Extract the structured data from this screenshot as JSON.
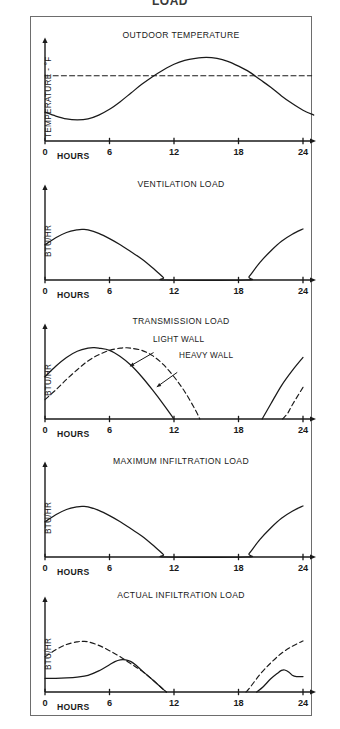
{
  "figure": {
    "cropped_heading": "LOAD",
    "x_axis_label": "HOURS",
    "x_ticks": [
      "0",
      "6",
      "12",
      "18",
      "24"
    ]
  },
  "chart_data": [
    {
      "type": "line",
      "title": "OUTDOOR TEMPERATURE",
      "xlabel": "HOURS",
      "ylabel": "TEMPERATURE - °F",
      "xlim": [
        0,
        24
      ],
      "ylim": [
        0,
        1
      ],
      "xticks": [
        0,
        6,
        12,
        18,
        24
      ],
      "grid": false,
      "legend": "inline-annotation",
      "annotations": [
        {
          "text": "INDOOR TEMPERATURE",
          "x": 1.2,
          "y": 0.74
        }
      ],
      "series": [
        {
          "name": "Outdoor temperature",
          "style": "solid",
          "x": [
            0,
            1,
            2,
            3,
            4,
            5,
            6,
            7,
            8,
            9,
            10,
            11,
            12,
            13,
            14,
            15,
            16,
            17,
            18,
            19,
            20,
            21,
            22,
            23,
            24,
            25
          ],
          "values": [
            0.3,
            0.26,
            0.23,
            0.22,
            0.23,
            0.27,
            0.33,
            0.41,
            0.5,
            0.59,
            0.67,
            0.74,
            0.8,
            0.84,
            0.86,
            0.87,
            0.86,
            0.83,
            0.78,
            0.72,
            0.64,
            0.56,
            0.47,
            0.39,
            0.32,
            0.27
          ]
        },
        {
          "name": "Indoor temperature",
          "style": "dashed",
          "x": [
            0,
            24.8
          ],
          "values": [
            0.68,
            0.68
          ]
        }
      ]
    },
    {
      "type": "line",
      "title": "VENTILATION LOAD",
      "xlabel": "HOURS",
      "ylabel": "BTU/HR",
      "xlim": [
        0,
        24
      ],
      "ylim": [
        0,
        1
      ],
      "xticks": [
        0,
        6,
        12,
        18,
        24
      ],
      "grid": false,
      "series": [
        {
          "name": "Ventilation load",
          "style": "solid",
          "x": [
            0,
            1,
            2,
            3,
            3.5,
            4,
            5,
            6,
            7,
            8,
            9,
            10,
            11,
            11.3,
            18.7,
            19,
            20,
            21,
            22,
            23,
            24
          ],
          "values": [
            0.4,
            0.48,
            0.54,
            0.57,
            0.575,
            0.57,
            0.53,
            0.47,
            0.4,
            0.32,
            0.24,
            0.14,
            0.03,
            0.0,
            0.0,
            0.04,
            0.2,
            0.33,
            0.44,
            0.52,
            0.58
          ]
        }
      ]
    },
    {
      "type": "line",
      "title": "TRANSMISSION LOAD",
      "xlabel": "HOURS",
      "ylabel": "BTU/HR",
      "xlim": [
        0,
        24
      ],
      "ylim": [
        0,
        1
      ],
      "xticks": [
        0,
        6,
        12,
        18,
        24
      ],
      "grid": false,
      "annotations": [
        {
          "text": "LIGHT WALL",
          "x": 10.4,
          "y": 0.8,
          "points_to": "Light wall"
        },
        {
          "text": "HEAVY WALL",
          "x": 12.6,
          "y": 0.62,
          "points_to": "Heavy wall"
        }
      ],
      "series": [
        {
          "name": "Light wall",
          "style": "solid",
          "x": [
            0,
            1,
            2,
            3,
            4,
            4.6,
            5,
            6,
            7,
            8,
            9,
            10,
            11,
            12
          ],
          "values": [
            0.48,
            0.6,
            0.7,
            0.77,
            0.805,
            0.81,
            0.805,
            0.78,
            0.71,
            0.61,
            0.48,
            0.33,
            0.17,
            0.0
          ]
        },
        {
          "name": "Heavy wall",
          "style": "dashed",
          "x": [
            0,
            1,
            2,
            3,
            4,
            5,
            6,
            7,
            7.6,
            8,
            9,
            10,
            11,
            12,
            13,
            14,
            14.4
          ],
          "values": [
            0.22,
            0.33,
            0.45,
            0.56,
            0.66,
            0.73,
            0.78,
            0.805,
            0.81,
            0.805,
            0.78,
            0.72,
            0.62,
            0.48,
            0.31,
            0.1,
            0.0
          ]
        },
        {
          "name": "Light wall evening",
          "style": "solid",
          "x": [
            20.2,
            21,
            22,
            23,
            24
          ],
          "values": [
            0.0,
            0.17,
            0.38,
            0.55,
            0.7
          ]
        },
        {
          "name": "Heavy wall evening",
          "style": "dashed",
          "x": [
            22.1,
            22.6,
            23,
            24
          ],
          "values": [
            0.0,
            0.07,
            0.16,
            0.36
          ]
        }
      ]
    },
    {
      "type": "line",
      "title": "MAXIMUM INFILTRATION LOAD",
      "xlabel": "HOURS",
      "ylabel": "BTU/HR",
      "xlim": [
        0,
        24
      ],
      "ylim": [
        0,
        1
      ],
      "xticks": [
        0,
        6,
        12,
        18,
        24
      ],
      "grid": false,
      "series": [
        {
          "name": "Maximum infiltration load",
          "style": "solid",
          "x": [
            0,
            1,
            2,
            3,
            3.5,
            4,
            5,
            6,
            7,
            8,
            9,
            10,
            11,
            11.3,
            18.7,
            19,
            20,
            21,
            22,
            23,
            24
          ],
          "values": [
            0.4,
            0.48,
            0.54,
            0.57,
            0.575,
            0.57,
            0.53,
            0.47,
            0.4,
            0.32,
            0.24,
            0.14,
            0.03,
            0.0,
            0.0,
            0.04,
            0.2,
            0.33,
            0.44,
            0.52,
            0.58
          ]
        }
      ]
    },
    {
      "type": "line",
      "title": "ACTUAL INFILTRATION LOAD",
      "xlabel": "HOURS",
      "ylabel": "BTU/HR",
      "xlim": [
        0,
        24
      ],
      "ylim": [
        0,
        1
      ],
      "xticks": [
        0,
        6,
        12,
        18,
        24
      ],
      "grid": false,
      "series": [
        {
          "name": "Maximum infiltration envelope",
          "style": "dashed",
          "x": [
            0,
            1,
            2,
            3,
            3.5,
            4,
            5,
            6,
            7,
            8,
            9,
            10,
            11,
            11.3
          ],
          "values": [
            0.4,
            0.48,
            0.54,
            0.57,
            0.575,
            0.57,
            0.53,
            0.47,
            0.4,
            0.32,
            0.24,
            0.14,
            0.03,
            0.0
          ]
        },
        {
          "name": "Maximum infiltration envelope evening",
          "style": "dashed",
          "x": [
            18.7,
            19,
            20,
            21,
            22,
            23,
            24
          ],
          "values": [
            0.0,
            0.04,
            0.2,
            0.33,
            0.44,
            0.52,
            0.58
          ]
        },
        {
          "name": "Actual infiltration load",
          "style": "solid",
          "x": [
            0,
            1,
            2,
            3,
            4,
            5,
            6,
            6.5,
            7,
            7.5,
            8,
            8.5,
            9,
            10,
            11,
            11.3
          ],
          "values": [
            0.155,
            0.155,
            0.16,
            0.17,
            0.19,
            0.24,
            0.31,
            0.345,
            0.365,
            0.365,
            0.345,
            0.3,
            0.245,
            0.14,
            0.03,
            0.0
          ]
        },
        {
          "name": "Actual infiltration load evening",
          "style": "solid",
          "x": [
            19.7,
            20.3,
            21,
            21.6,
            22,
            22.3,
            22.7,
            23,
            23.4,
            24
          ],
          "values": [
            0.0,
            0.06,
            0.15,
            0.21,
            0.245,
            0.25,
            0.225,
            0.19,
            0.175,
            0.175
          ]
        }
      ]
    }
  ]
}
